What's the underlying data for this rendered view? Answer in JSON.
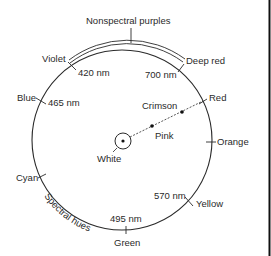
{
  "diagram": {
    "title": "Nonspectral purples",
    "arc_label": "Spectral hues",
    "center_label": "White",
    "hues": [
      {
        "name": "Violet",
        "wavelength": "420 nm"
      },
      {
        "name": "Deep red",
        "wavelength": "700 nm"
      },
      {
        "name": "Blue",
        "wavelength": "465 nm"
      },
      {
        "name": "Red",
        "wavelength": ""
      },
      {
        "name": "Orange",
        "wavelength": ""
      },
      {
        "name": "Yellow",
        "wavelength": "570 nm"
      },
      {
        "name": "Green",
        "wavelength": "495 nm"
      },
      {
        "name": "Cyan",
        "wavelength": ""
      }
    ],
    "saturation_line": [
      "White",
      "Pink",
      "Crimson",
      "Red"
    ],
    "inner_points": {
      "pink": "Pink",
      "crimson": "Crimson"
    }
  }
}
